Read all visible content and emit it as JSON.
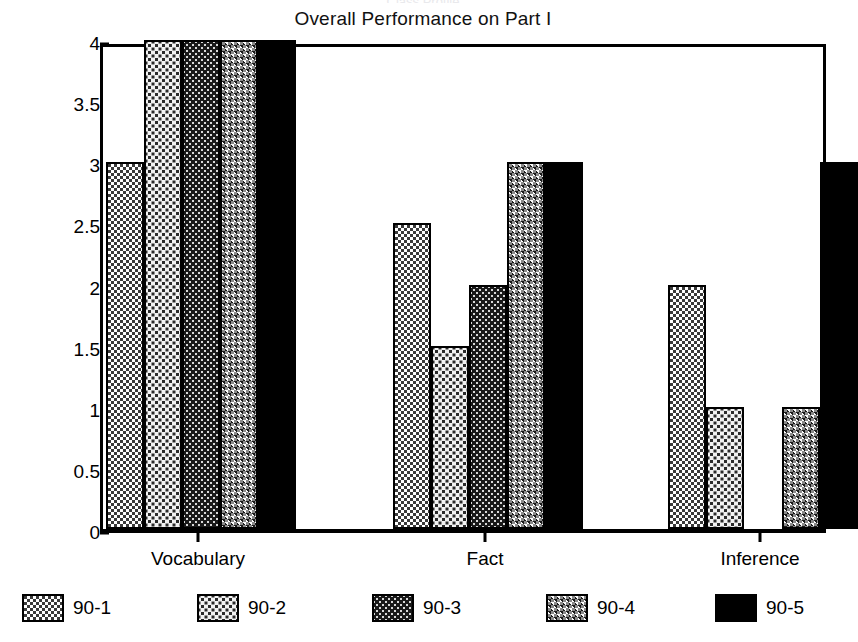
{
  "chart_data": {
    "type": "bar",
    "title": "Overall Performance on Part I",
    "suptitle": "Class Profile",
    "xlabel": "",
    "ylabel": "",
    "categories": [
      "Vocabulary",
      "Fact",
      "Inference"
    ],
    "ylim": [
      0,
      4
    ],
    "ytick_labels": [
      "0",
      "0.5",
      "1",
      "1.5",
      "2",
      "2.5",
      "3",
      "3.5",
      "4"
    ],
    "ytick_values": [
      0,
      0.5,
      1,
      1.5,
      2,
      2.5,
      3,
      3.5,
      4
    ],
    "grid": false,
    "legend_position": "bottom",
    "series": [
      {
        "name": "90-1",
        "pattern": "checker-dark",
        "values": [
          3,
          2.5,
          2
        ]
      },
      {
        "name": "90-2",
        "pattern": "dots-light",
        "values": [
          4,
          1.5,
          1
        ]
      },
      {
        "name": "90-3",
        "pattern": "dots-dark",
        "values": [
          4,
          2,
          0
        ]
      },
      {
        "name": "90-4",
        "pattern": "checker-gray",
        "values": [
          4,
          3,
          1
        ]
      },
      {
        "name": "90-5",
        "pattern": "solid-black",
        "values": [
          4,
          3,
          3
        ]
      }
    ]
  },
  "colors": {
    "axis": "#000000",
    "background": "#ffffff",
    "series_90_1": "#3a3a3a",
    "series_90_2": "#f2f2f2",
    "series_90_3": "#191919",
    "series_90_4": "#8a8a8a",
    "series_90_5": "#000000"
  }
}
